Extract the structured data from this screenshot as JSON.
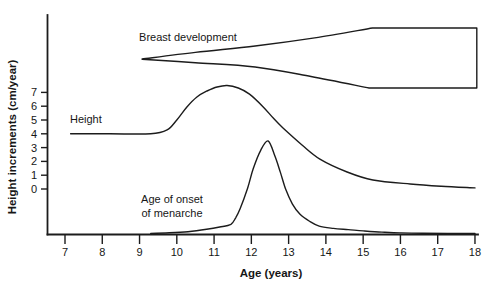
{
  "figure": {
    "y_axis_label": "Height increments (cm/year)",
    "x_axis_label": "Age (years)",
    "labels": {
      "breast": "Breast development",
      "height": "Height",
      "menarche_line1": "Age of onset",
      "menarche_line2": "of menarche"
    },
    "colors": {
      "line": "#1c1c1c",
      "text": "#161616",
      "background": "#ffffff"
    }
  },
  "chart_data": {
    "type": "line",
    "title": "",
    "xlabel": "Age (years)",
    "ylabel": "Height increments (cm/year)",
    "xlim": [
      7,
      18
    ],
    "ylim_ticks": [
      0,
      7
    ],
    "grid": "off",
    "legend": "none (curves labeled inline)",
    "x_ticks": [
      7,
      8,
      9,
      10,
      11,
      12,
      13,
      14,
      15,
      16,
      17,
      18
    ],
    "y_ticks": [
      0,
      1,
      2,
      3,
      4,
      5,
      6,
      7
    ],
    "series": [
      {
        "name": "Height",
        "type": "line",
        "units": "cm/year",
        "points": [
          [
            7.15,
            4.0
          ],
          [
            8.2,
            4.0
          ],
          [
            9.3,
            4.0
          ],
          [
            9.74,
            4.28
          ],
          [
            10.0,
            5.0
          ],
          [
            10.27,
            5.94
          ],
          [
            10.54,
            6.67
          ],
          [
            10.81,
            7.1
          ],
          [
            11.08,
            7.39
          ],
          [
            11.35,
            7.5
          ],
          [
            11.65,
            7.32
          ],
          [
            11.95,
            6.88
          ],
          [
            12.3,
            6.0
          ],
          [
            12.6,
            5.1
          ],
          [
            12.85,
            4.42
          ],
          [
            13.36,
            3.19
          ],
          [
            13.84,
            2.17
          ],
          [
            14.57,
            1.23
          ],
          [
            15.26,
            0.65
          ],
          [
            16.26,
            0.36
          ],
          [
            17.1,
            0.2
          ],
          [
            18.0,
            0.08
          ]
        ]
      },
      {
        "name": "Age of onset of menarche",
        "type": "distribution",
        "baseline": "x-axis",
        "peak_age": 12.45,
        "relative_points": [
          [
            9.3,
            0.0
          ],
          [
            9.8,
            0.008
          ],
          [
            10.3,
            0.02
          ],
          [
            10.8,
            0.045
          ],
          [
            11.15,
            0.07
          ],
          [
            11.45,
            0.1
          ],
          [
            11.58,
            0.17
          ],
          [
            11.7,
            0.27
          ],
          [
            11.9,
            0.49
          ],
          [
            12.05,
            0.7
          ],
          [
            12.25,
            0.9
          ],
          [
            12.45,
            1.0
          ],
          [
            12.63,
            0.84
          ],
          [
            12.78,
            0.66
          ],
          [
            12.92,
            0.48
          ],
          [
            13.1,
            0.32
          ],
          [
            13.3,
            0.21
          ],
          [
            13.57,
            0.13
          ],
          [
            13.82,
            0.08
          ],
          [
            14.2,
            0.055
          ],
          [
            14.6,
            0.042
          ],
          [
            15.0,
            0.028
          ],
          [
            15.5,
            0.015
          ],
          [
            16.0,
            0.007
          ],
          [
            16.6,
            0.002
          ],
          [
            18.0,
            0.0
          ]
        ]
      },
      {
        "name": "Breast development",
        "type": "band",
        "description": "wedge starting as a point near age 9.1, widening until ~age 15.2, then constant-width bar to age 18",
        "start_age": 9.07,
        "full_width_age": 15.2,
        "end_age": 18.05,
        "outline_top": [
          [
            9.07,
            9.42
          ],
          [
            10.5,
            9.9
          ],
          [
            12.1,
            10.36
          ],
          [
            13.7,
            10.95
          ],
          [
            15.25,
            11.67
          ]
        ],
        "outline_bottom": [
          [
            15.16,
            7.32
          ],
          [
            13.6,
            8.15
          ],
          [
            12.1,
            8.84
          ],
          [
            10.5,
            9.15
          ],
          [
            9.07,
            9.4
          ]
        ],
        "band_top_value": 11.67,
        "band_bottom_value": 7.32
      }
    ]
  }
}
